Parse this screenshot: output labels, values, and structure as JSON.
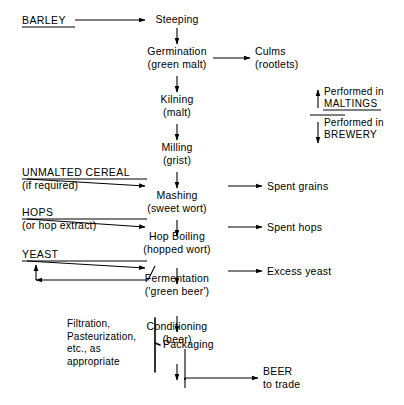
{
  "diagram": {
    "background_color": "#ffffff",
    "line_color": "#000000",
    "process_nodes": [
      {
        "id": "steeping",
        "label": "Steeping",
        "sublabel": ""
      },
      {
        "id": "germination",
        "label": "Germination",
        "sublabel": "(green malt)"
      },
      {
        "id": "kilning",
        "label": "Kilning",
        "sublabel": "(malt)"
      },
      {
        "id": "milling",
        "label": "Milling",
        "sublabel": "(grist)"
      },
      {
        "id": "mashing",
        "label": "Mashing",
        "sublabel": "(sweet wort)"
      },
      {
        "id": "hop_boiling",
        "label": "Hop Boiling",
        "sublabel": "(hopped wort)"
      },
      {
        "id": "fermentation",
        "label": "Fermentation",
        "sublabel": "('green beer')"
      },
      {
        "id": "conditioning",
        "label": "Conditioning",
        "sublabel": "(beer)"
      },
      {
        "id": "packaging",
        "label": "Packaging",
        "sublabel": ""
      }
    ],
    "inputs": [
      {
        "id": "barley",
        "label": "BARLEY",
        "sublabel": "",
        "target": "steeping"
      },
      {
        "id": "unmalted_cereal",
        "label": "UNMALTED CEREAL",
        "sublabel": "(if required)",
        "target": "mashing"
      },
      {
        "id": "hops",
        "label": "HOPS",
        "sublabel": "(or hop extract)",
        "target": "hop_boiling"
      },
      {
        "id": "yeast",
        "label": "YEAST",
        "sublabel": "",
        "target": "fermentation"
      }
    ],
    "outputs": [
      {
        "id": "culms",
        "label": "Culms",
        "sublabel": "(rootlets)",
        "source": "germination"
      },
      {
        "id": "spent_grains",
        "label": "Spent grains",
        "sublabel": "",
        "source": "mashing"
      },
      {
        "id": "spent_hops",
        "label": "Spent hops",
        "sublabel": "",
        "source": "hop_boiling"
      },
      {
        "id": "excess_yeast",
        "label": "Excess yeast",
        "sublabel": "",
        "source": "fermentation"
      },
      {
        "id": "beer",
        "label": "BEER",
        "sublabel": "to trade",
        "source": "packaging"
      }
    ],
    "recycle": {
      "id": "yeast_recycle",
      "from": "fermentation",
      "to": "yeast"
    },
    "legend": {
      "upper_performed": "Performed in",
      "upper_place": "MALTINGS",
      "lower_performed": "Performed in",
      "lower_place": "BREWERY"
    },
    "packaging_note": {
      "line1": "Filtration,",
      "line2": "Pasteurization,",
      "line3": "etc., as",
      "line4": "appropriate"
    }
  }
}
